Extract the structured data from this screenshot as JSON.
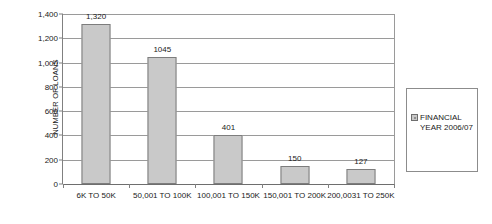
{
  "chart_data": {
    "type": "bar",
    "title": "",
    "xlabel": "",
    "ylabel": "NUMBER OF LOANS",
    "ylim": [
      0,
      1400
    ],
    "ytick_step": 200,
    "ytick_labels": [
      "0",
      "200",
      "400",
      "600",
      "800",
      "1,000",
      "1,200",
      "1,400"
    ],
    "grid": true,
    "legend_position": "right",
    "categories": [
      "6K TO 50K",
      "50,001 TO 100K",
      "100,001 TO 150K",
      "150,001 TO 200K",
      "200,0031 TO 250K"
    ],
    "values": [
      1320,
      1045,
      401,
      150,
      127
    ],
    "value_labels": [
      "1,320",
      "1045",
      "401",
      "150",
      "127"
    ],
    "series": [
      {
        "name": "FINANCIAL YEAR 2006/07",
        "values": [
          1320,
          1045,
          401,
          150,
          127
        ],
        "color": "#c9c9c9"
      }
    ]
  },
  "legend": {
    "entries": [
      {
        "label": "FINANCIAL\nYEAR 2006/07",
        "color": "#c9c9c9"
      }
    ]
  },
  "colors": {
    "bar_fill": "#c9c9c9",
    "bar_border": "#7d7d7d",
    "gridline": "#9a9a9a",
    "axis": "#808080",
    "text": "#1a1a1a"
  }
}
